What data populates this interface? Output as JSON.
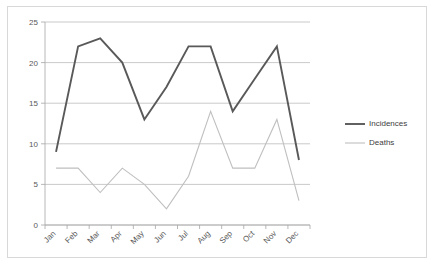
{
  "chart_data": {
    "type": "line",
    "title": "",
    "subtitle": "",
    "xlabel": "",
    "ylabel": "",
    "categories": [
      "Jan",
      "Feb",
      "Mar",
      "Apr",
      "May",
      "Jun",
      "Jul",
      "Aug",
      "Sep",
      "Oct",
      "Nov",
      "Dec"
    ],
    "series": [
      {
        "name": "Incidences",
        "color": "#595959",
        "stroke_width": 1.9,
        "values": [
          9,
          22,
          23,
          20,
          13,
          17,
          22,
          22,
          14,
          18,
          22,
          8
        ]
      },
      {
        "name": "Deaths",
        "color": "#bfbfbf",
        "stroke_width": 1.1,
        "values": [
          7,
          7,
          4,
          7,
          5,
          2,
          6,
          14,
          7,
          7,
          13,
          3
        ]
      }
    ],
    "ylim": [
      0,
      25
    ],
    "yticks": [
      0,
      5,
      10,
      15,
      20,
      25
    ],
    "ytick_labels": [
      "0",
      "5",
      "10",
      "15",
      "20",
      "25"
    ],
    "grid": true,
    "grid_axis": "y",
    "legend_position": "right",
    "xtick_rotation": -45
  },
  "legend": {
    "entries": [
      {
        "label": "Incidences"
      },
      {
        "label": "Deaths"
      }
    ]
  },
  "colors": {
    "incidences": "#595959",
    "deaths": "#bfbfbf",
    "gridline": "#b3b3b3",
    "axis": "#a6a6a6",
    "frame": "#d8d8d8",
    "background": "#ffffff",
    "tick_text": "#595959",
    "legend_text": "#404040"
  }
}
